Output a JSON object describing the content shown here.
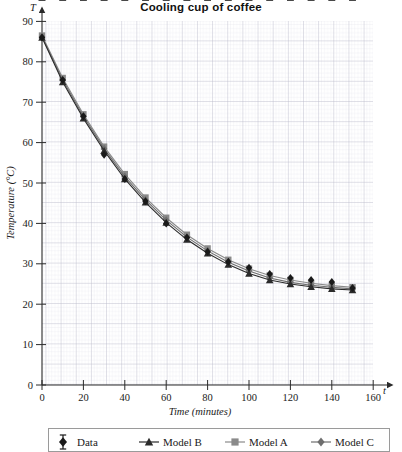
{
  "chart_data": {
    "type": "line",
    "title": "Cooling cup of coffee",
    "xlabel": "Time (minutes)",
    "ylabel": "Temperature (°C)",
    "x_axis_symbol": "t",
    "y_axis_symbol": "T",
    "xlim": [
      0,
      160
    ],
    "ylim": [
      0,
      90
    ],
    "xticks": [
      0,
      20,
      40,
      60,
      80,
      100,
      120,
      140,
      160
    ],
    "xtick_labels": [
      "0",
      "20",
      "40",
      "60",
      "80",
      "100",
      "120",
      "140",
      "160"
    ],
    "yticks": [
      0,
      10,
      20,
      30,
      40,
      50,
      60,
      70,
      80,
      90
    ],
    "ytick_labels": [
      "0",
      "10",
      "20",
      "30",
      "40",
      "50",
      "60",
      "70",
      "80",
      "90"
    ],
    "grid": "minor and major grid, major every 10 minutes / 5 degrees",
    "legend_position": "below-plot",
    "x": [
      0,
      10,
      20,
      30,
      40,
      50,
      60,
      70,
      80,
      90,
      100,
      110,
      120,
      130,
      140,
      150
    ],
    "series": [
      {
        "name": "Data",
        "marker": "diamond",
        "color": "#1a1a1a",
        "has_error_bars": true,
        "error": 3,
        "values": [
          86.0,
          75.5,
          66.5,
          57.0,
          51.0,
          45.5,
          40.0,
          36.5,
          33.0,
          30.5,
          29.0,
          27.5,
          26.5,
          26.0,
          25.5,
          24.0
        ]
      },
      {
        "name": "Model B",
        "marker": "triangle",
        "color": "#2b2b2b",
        "has_error_bars": false,
        "values": [
          86.0,
          75.0,
          66.0,
          58.0,
          51.0,
          45.2,
          40.2,
          36.0,
          32.6,
          29.8,
          27.6,
          26.0,
          25.0,
          24.3,
          23.8,
          23.5
        ]
      },
      {
        "name": "Model A",
        "marker": "square",
        "color": "#8a8a8a",
        "has_error_bars": false,
        "values": [
          86.5,
          76.0,
          67.0,
          59.0,
          52.2,
          46.4,
          41.4,
          37.2,
          33.8,
          31.0,
          28.8,
          27.1,
          26.0,
          25.2,
          24.6,
          24.2
        ]
      },
      {
        "name": "Model C",
        "marker": "diamond",
        "color": "#6e6e6e",
        "has_error_bars": false,
        "values": [
          86.2,
          75.5,
          66.5,
          58.5,
          51.6,
          45.8,
          40.8,
          36.6,
          33.2,
          30.4,
          28.2,
          26.5,
          25.4,
          24.7,
          24.2,
          23.8
        ]
      }
    ],
    "legend": [
      {
        "label": "Data",
        "marker": "diamond-errorbar",
        "color": "#1a1a1a"
      },
      {
        "label": "Model B",
        "marker": "triangle-line",
        "color": "#2b2b2b"
      },
      {
        "label": "Model A",
        "marker": "square-line",
        "color": "#8a8a8a"
      },
      {
        "label": "Model C",
        "marker": "diamond-line",
        "color": "#6e6e6e"
      }
    ]
  },
  "colors": {
    "grid_minor": "#dcdce4",
    "grid_major": "#b9b9c6",
    "axis": "#3a3a3a",
    "background": "#ffffff"
  }
}
